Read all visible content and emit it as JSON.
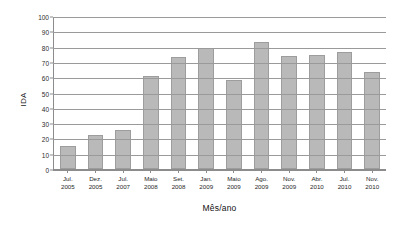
{
  "chart_data": {
    "type": "bar",
    "title": "",
    "xlabel": "Mês/ano",
    "ylabel": "IDA",
    "ylim": [
      0,
      100
    ],
    "ytick_step": 10,
    "grid": true,
    "legend": false,
    "bar_color": "#b9b9b9",
    "bar_edge_color": "#9d9d9d",
    "grid_color": "#9a9a9a",
    "yticks": [
      "0",
      "10",
      "20",
      "30",
      "40",
      "50",
      "60",
      "70",
      "80",
      "90",
      "100"
    ],
    "categories": [
      "Jul.\n2005",
      "Dez.\n2005",
      "Jul.\n2007",
      "Maio\n2008",
      "Set.\n2008",
      "Jan.\n2009",
      "Maio\n2009",
      "Ago.\n2009",
      "Nov.\n2009",
      "Abr.\n2010",
      "Jul.\n2010",
      "Nov.\n2010"
    ],
    "category_months": [
      "Jul.",
      "Dez.",
      "Jul.",
      "Maio",
      "Set.",
      "Jan.",
      "Maio",
      "Ago.",
      "Nov.",
      "Abr.",
      "Jul.",
      "Nov."
    ],
    "category_years": [
      "2005",
      "2005",
      "2007",
      "2008",
      "2008",
      "2009",
      "2009",
      "2009",
      "2009",
      "2010",
      "2010",
      "2010"
    ],
    "values": [
      15,
      22,
      25.5,
      60.5,
      73.5,
      79,
      58,
      83,
      73.7,
      74.3,
      76.6,
      63.7
    ]
  }
}
